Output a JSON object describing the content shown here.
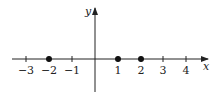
{
  "diagram": {
    "type": "number-line-on-coordinate-axes",
    "x_axis_label": "x",
    "y_axis_label": "y",
    "ticks": [
      {
        "value": -3,
        "label": "−3"
      },
      {
        "value": -2,
        "label": "−2"
      },
      {
        "value": -1,
        "label": "−1"
      },
      {
        "value": 1,
        "label": "1"
      },
      {
        "value": 2,
        "label": "2"
      },
      {
        "value": 3,
        "label": "3"
      },
      {
        "value": 4,
        "label": "4"
      }
    ],
    "points": [
      -2,
      1,
      2
    ],
    "colors": {
      "line": "#222222",
      "point": "#111111",
      "background": "#ffffff"
    }
  }
}
